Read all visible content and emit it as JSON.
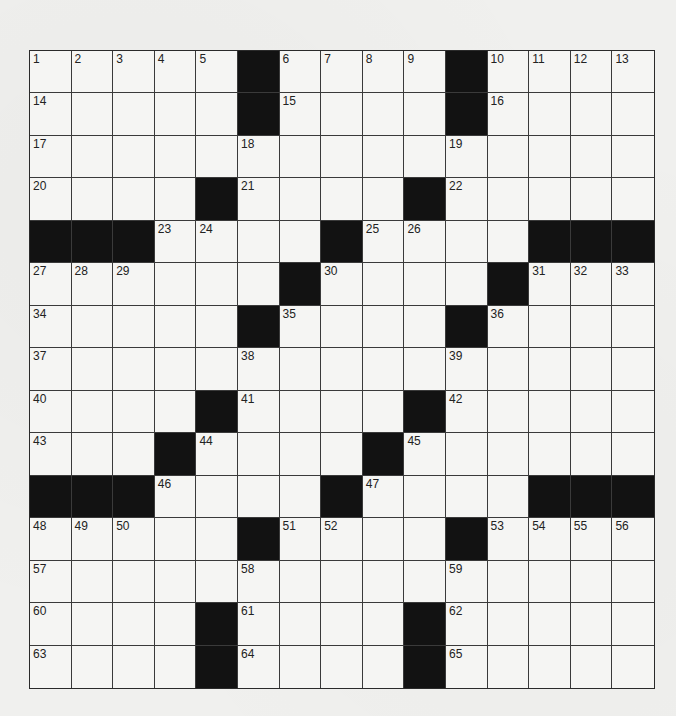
{
  "puzzle": {
    "rows": 15,
    "cols": 15,
    "colors": {
      "background": "#f0f0ee",
      "cell": "#f5f5f3",
      "block": "#121212",
      "line": "#3a3a3a",
      "number": "#222222"
    },
    "blocks": [
      [
        0,
        5
      ],
      [
        0,
        10
      ],
      [
        1,
        5
      ],
      [
        1,
        10
      ],
      [
        3,
        4
      ],
      [
        3,
        9
      ],
      [
        4,
        0
      ],
      [
        4,
        1
      ],
      [
        4,
        2
      ],
      [
        4,
        7
      ],
      [
        4,
        12
      ],
      [
        4,
        13
      ],
      [
        4,
        14
      ],
      [
        5,
        6
      ],
      [
        5,
        11
      ],
      [
        6,
        5
      ],
      [
        6,
        10
      ],
      [
        8,
        4
      ],
      [
        8,
        9
      ],
      [
        9,
        3
      ],
      [
        9,
        8
      ],
      [
        10,
        0
      ],
      [
        10,
        1
      ],
      [
        10,
        2
      ],
      [
        10,
        7
      ],
      [
        10,
        12
      ],
      [
        10,
        13
      ],
      [
        10,
        14
      ],
      [
        11,
        5
      ],
      [
        11,
        10
      ],
      [
        13,
        4
      ],
      [
        13,
        9
      ],
      [
        14,
        4
      ],
      [
        14,
        9
      ]
    ],
    "numbers": [
      {
        "r": 0,
        "c": 0,
        "n": "1"
      },
      {
        "r": 0,
        "c": 1,
        "n": "2"
      },
      {
        "r": 0,
        "c": 2,
        "n": "3"
      },
      {
        "r": 0,
        "c": 3,
        "n": "4"
      },
      {
        "r": 0,
        "c": 4,
        "n": "5"
      },
      {
        "r": 0,
        "c": 6,
        "n": "6"
      },
      {
        "r": 0,
        "c": 7,
        "n": "7"
      },
      {
        "r": 0,
        "c": 8,
        "n": "8"
      },
      {
        "r": 0,
        "c": 9,
        "n": "9"
      },
      {
        "r": 0,
        "c": 11,
        "n": "10"
      },
      {
        "r": 0,
        "c": 12,
        "n": "11"
      },
      {
        "r": 0,
        "c": 13,
        "n": "12"
      },
      {
        "r": 0,
        "c": 14,
        "n": "13"
      },
      {
        "r": 1,
        "c": 0,
        "n": "14"
      },
      {
        "r": 1,
        "c": 6,
        "n": "15"
      },
      {
        "r": 1,
        "c": 11,
        "n": "16"
      },
      {
        "r": 2,
        "c": 0,
        "n": "17"
      },
      {
        "r": 2,
        "c": 5,
        "n": "18"
      },
      {
        "r": 2,
        "c": 10,
        "n": "19"
      },
      {
        "r": 3,
        "c": 0,
        "n": "20"
      },
      {
        "r": 3,
        "c": 5,
        "n": "21"
      },
      {
        "r": 3,
        "c": 10,
        "n": "22"
      },
      {
        "r": 4,
        "c": 3,
        "n": "23"
      },
      {
        "r": 4,
        "c": 4,
        "n": "24"
      },
      {
        "r": 4,
        "c": 8,
        "n": "25"
      },
      {
        "r": 4,
        "c": 9,
        "n": "26"
      },
      {
        "r": 5,
        "c": 0,
        "n": "27"
      },
      {
        "r": 5,
        "c": 1,
        "n": "28"
      },
      {
        "r": 5,
        "c": 2,
        "n": "29"
      },
      {
        "r": 5,
        "c": 7,
        "n": "30"
      },
      {
        "r": 5,
        "c": 12,
        "n": "31"
      },
      {
        "r": 5,
        "c": 13,
        "n": "32"
      },
      {
        "r": 5,
        "c": 14,
        "n": "33"
      },
      {
        "r": 6,
        "c": 0,
        "n": "34"
      },
      {
        "r": 6,
        "c": 6,
        "n": "35"
      },
      {
        "r": 6,
        "c": 11,
        "n": "36"
      },
      {
        "r": 7,
        "c": 0,
        "n": "37"
      },
      {
        "r": 7,
        "c": 5,
        "n": "38"
      },
      {
        "r": 7,
        "c": 10,
        "n": "39"
      },
      {
        "r": 8,
        "c": 0,
        "n": "40"
      },
      {
        "r": 8,
        "c": 5,
        "n": "41"
      },
      {
        "r": 8,
        "c": 10,
        "n": "42"
      },
      {
        "r": 9,
        "c": 0,
        "n": "43"
      },
      {
        "r": 9,
        "c": 4,
        "n": "44"
      },
      {
        "r": 9,
        "c": 9,
        "n": "45"
      },
      {
        "r": 10,
        "c": 3,
        "n": "46"
      },
      {
        "r": 10,
        "c": 8,
        "n": "47"
      },
      {
        "r": 11,
        "c": 0,
        "n": "48"
      },
      {
        "r": 11,
        "c": 1,
        "n": "49"
      },
      {
        "r": 11,
        "c": 2,
        "n": "50"
      },
      {
        "r": 11,
        "c": 6,
        "n": "51"
      },
      {
        "r": 11,
        "c": 7,
        "n": "52"
      },
      {
        "r": 11,
        "c": 11,
        "n": "53"
      },
      {
        "r": 11,
        "c": 12,
        "n": "54"
      },
      {
        "r": 11,
        "c": 13,
        "n": "55"
      },
      {
        "r": 11,
        "c": 14,
        "n": "56"
      },
      {
        "r": 12,
        "c": 0,
        "n": "57"
      },
      {
        "r": 12,
        "c": 5,
        "n": "58"
      },
      {
        "r": 12,
        "c": 10,
        "n": "59"
      },
      {
        "r": 13,
        "c": 0,
        "n": "60"
      },
      {
        "r": 13,
        "c": 5,
        "n": "61"
      },
      {
        "r": 13,
        "c": 10,
        "n": "62"
      },
      {
        "r": 14,
        "c": 0,
        "n": "63"
      },
      {
        "r": 14,
        "c": 5,
        "n": "64"
      },
      {
        "r": 14,
        "c": 10,
        "n": "65"
      }
    ],
    "fills": []
  }
}
